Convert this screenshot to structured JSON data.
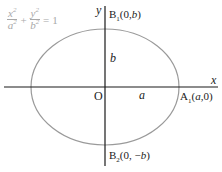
{
  "equation": {
    "term1": {
      "numerator": "x",
      "denominator": "a",
      "power": "2"
    },
    "plus": "+",
    "term2": {
      "numerator": "y",
      "denominator": "b",
      "power": "2"
    },
    "equals": "=",
    "rhs": "1"
  },
  "axes": {
    "x_label": "x",
    "y_label": "y",
    "origin_label": "O"
  },
  "segments": {
    "semi_major_label": "a",
    "semi_minor_label": "b"
  },
  "vertices": {
    "A1": {
      "name": "A",
      "subscript": "1",
      "coords_open": "(",
      "coords_x": "a",
      "coords_sep": ",",
      "coords_y": "0",
      "coords_close": ")"
    },
    "B1": {
      "name": "B",
      "subscript": "1",
      "coords_open": "(0,",
      "coords_y": "b",
      "coords_close": ")"
    },
    "B2": {
      "name": "B",
      "subscript": "2",
      "coords_open": "(0, −",
      "coords_y": "b",
      "coords_close": ")"
    }
  },
  "colors": {
    "axis": "#1a1a1a",
    "ellipse": "#9a9a9a",
    "equation": "#a8a8a8"
  }
}
